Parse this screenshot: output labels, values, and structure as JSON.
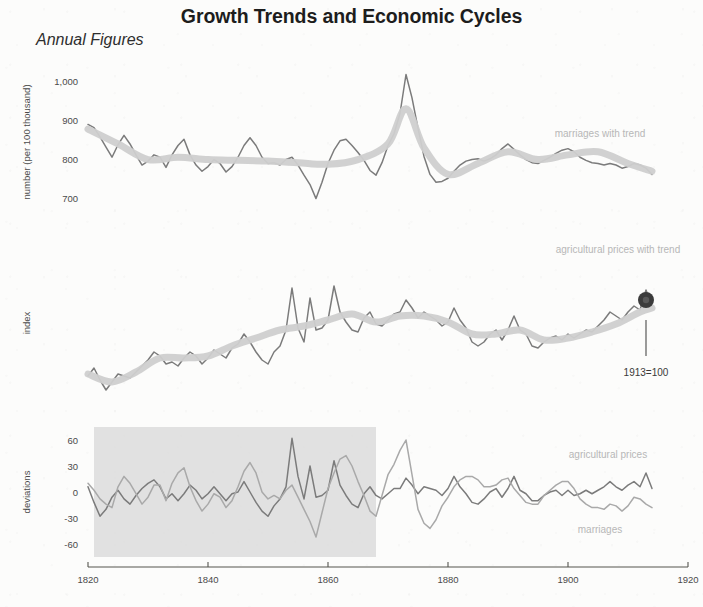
{
  "header": {
    "title": "Growth Trends and Economic Cycles",
    "subtitle": "Annual Figures"
  },
  "labels": {
    "marriages_with_trend": "marriages with trend",
    "agricultural_prices_with_trend": "agricultural prices with trend",
    "agricultural_prices": "agricultural prices",
    "marriages": "marriages",
    "base_note": "1913=100"
  },
  "axis": {
    "x_ticks": [
      "1820",
      "1840",
      "1860",
      "1880",
      "1900",
      "1920"
    ],
    "panel1_y_label": "number (per 100 thousand)",
    "panel1_y_ticks": [
      "1,000",
      "900",
      "800",
      "700"
    ],
    "panel2_y_label": "index",
    "panel2_y_ticks": [],
    "panel3_y_label": "deviations",
    "panel3_y_ticks": [
      "60",
      "30",
      "0",
      "-30",
      "-60"
    ]
  },
  "colors": {
    "data_line": "#7b7b7b",
    "data_line_light": "#a9a9a9",
    "trend_band": "#cfcfcf",
    "shade_region": "#d7d7d7",
    "axis": "#55554f",
    "series_label": "#b7b7b7",
    "title": "#1d1d1d",
    "background": "#fcfcfb"
  },
  "chart_data": {
    "type": "line",
    "title": "Growth Trends and Economic Cycles",
    "subtitle": "Annual Figures",
    "xlabel": "",
    "xlim": [
      1820,
      1920
    ],
    "grid": false,
    "legend": "inline-labels",
    "panels": [
      {
        "id": "marriages",
        "ylabel": "number (per 100 thousand)",
        "ylim": [
          640,
          1050
        ],
        "yticks": [
          700,
          800,
          900,
          1000
        ],
        "series": [
          {
            "name": "marriages",
            "style": "thin-line",
            "x": [
              1820,
              1821,
              1822,
              1823,
              1824,
              1825,
              1826,
              1827,
              1828,
              1829,
              1830,
              1831,
              1832,
              1833,
              1834,
              1835,
              1836,
              1837,
              1838,
              1839,
              1840,
              1841,
              1842,
              1843,
              1844,
              1845,
              1846,
              1847,
              1848,
              1849,
              1850,
              1851,
              1852,
              1853,
              1854,
              1855,
              1856,
              1857,
              1858,
              1859,
              1860,
              1861,
              1862,
              1863,
              1864,
              1865,
              1866,
              1867,
              1868,
              1869,
              1870,
              1871,
              1872,
              1873,
              1874,
              1875,
              1876,
              1877,
              1878,
              1879,
              1880,
              1881,
              1882,
              1883,
              1884,
              1885,
              1886,
              1887,
              1888,
              1889,
              1890,
              1891,
              1892,
              1893,
              1894,
              1895,
              1896,
              1897,
              1898,
              1899,
              1900,
              1901,
              1902,
              1903,
              1904,
              1905,
              1906,
              1907,
              1908,
              1909,
              1910,
              1911,
              1912,
              1913,
              1914
            ],
            "values": [
              890,
              882,
              858,
              832,
              806,
              838,
              862,
              840,
              812,
              786,
              796,
              812,
              806,
              780,
              812,
              836,
              852,
              812,
              786,
              770,
              782,
              800,
              790,
              768,
              782,
              806,
              836,
              856,
              836,
              806,
              790,
              792,
              786,
              800,
              806,
              786,
              760,
              736,
              700,
              742,
              790,
              824,
              848,
              852,
              836,
              818,
              798,
              772,
              760,
              792,
              836,
              866,
              918,
              1018,
              958,
              880,
              808,
              762,
              742,
              744,
              752,
              770,
              786,
              796,
              800,
              802,
              796,
              802,
              812,
              828,
              840,
              826,
              812,
              800,
              792,
              790,
              798,
              806,
              816,
              824,
              828,
              820,
              806,
              798,
              792,
              790,
              786,
              790,
              786,
              778,
              782,
              790,
              786,
              778,
              762
            ]
          },
          {
            "name": "marriages trend",
            "style": "thick-band",
            "x": [
              1820,
              1825,
              1830,
              1835,
              1840,
              1845,
              1850,
              1855,
              1860,
              1865,
              1870,
              1873,
              1876,
              1880,
              1885,
              1890,
              1895,
              1900,
              1905,
              1910,
              1914
            ],
            "values": [
              878,
              840,
              800,
              806,
              800,
              798,
              796,
              792,
              788,
              800,
              840,
              930,
              830,
              762,
              790,
              820,
              800,
              812,
              820,
              790,
              770
            ]
          }
        ]
      },
      {
        "id": "agricultural_prices",
        "ylabel": "index",
        "ylim": [
          40,
          190
        ],
        "yticks": [],
        "series": [
          {
            "name": "agricultural prices",
            "style": "thin-line",
            "x": [
              1820,
              1821,
              1822,
              1823,
              1824,
              1825,
              1826,
              1827,
              1828,
              1829,
              1830,
              1831,
              1832,
              1833,
              1834,
              1835,
              1836,
              1837,
              1838,
              1839,
              1840,
              1841,
              1842,
              1843,
              1844,
              1845,
              1846,
              1847,
              1848,
              1849,
              1850,
              1851,
              1852,
              1853,
              1854,
              1855,
              1856,
              1857,
              1858,
              1859,
              1860,
              1861,
              1862,
              1863,
              1864,
              1865,
              1866,
              1867,
              1868,
              1869,
              1870,
              1871,
              1872,
              1873,
              1874,
              1875,
              1876,
              1877,
              1878,
              1879,
              1880,
              1881,
              1882,
              1883,
              1884,
              1885,
              1886,
              1887,
              1888,
              1889,
              1890,
              1891,
              1892,
              1893,
              1894,
              1895,
              1896,
              1897,
              1898,
              1899,
              1900,
              1901,
              1902,
              1903,
              1904,
              1905,
              1906,
              1907,
              1908,
              1909,
              1910,
              1911,
              1912,
              1913,
              1914
            ],
            "values": [
              62,
              70,
              58,
              48,
              56,
              64,
              62,
              60,
              66,
              72,
              78,
              86,
              82,
              74,
              76,
              72,
              80,
              86,
              82,
              74,
              80,
              88,
              84,
              80,
              90,
              94,
              104,
              96,
              86,
              78,
              74,
              86,
              92,
              108,
              150,
              110,
              96,
              140,
              108,
              110,
              118,
              152,
              126,
              116,
              108,
              106,
              120,
              126,
              114,
              112,
              118,
              124,
              126,
              138,
              130,
              120,
              126,
              122,
              118,
              112,
              116,
              130,
              118,
              110,
              96,
              92,
              96,
              104,
              108,
              98,
              108,
              122,
              108,
              104,
              92,
              90,
              96,
              100,
              102,
              98,
              104,
              100,
              104,
              108,
              106,
              112,
              118,
              126,
              122,
              118,
              126,
              132,
              128,
              148,
              132
            ]
          },
          {
            "name": "agricultural prices trend",
            "style": "thick-band",
            "x": [
              1820,
              1824,
              1828,
              1832,
              1836,
              1840,
              1844,
              1848,
              1852,
              1856,
              1860,
              1864,
              1868,
              1872,
              1876,
              1880,
              1884,
              1888,
              1892,
              1896,
              1900,
              1904,
              1908,
              1912,
              1914
            ],
            "values": [
              64,
              56,
              66,
              80,
              80,
              82,
              92,
              100,
              108,
              112,
              118,
              124,
              116,
              122,
              122,
              116,
              104,
              104,
              108,
              98,
              100,
              106,
              114,
              126,
              130
            ]
          }
        ]
      },
      {
        "id": "deviations",
        "ylabel": "deviations",
        "ylim": [
          -75,
          75
        ],
        "yticks": [
          -60,
          -30,
          0,
          30,
          60
        ],
        "shaded_region": {
          "from": 1821,
          "to": 1868
        },
        "series": [
          {
            "name": "agricultural prices",
            "style": "thin-line-dark",
            "x": [
              1820,
              1821,
              1822,
              1823,
              1824,
              1825,
              1826,
              1827,
              1828,
              1829,
              1830,
              1831,
              1832,
              1833,
              1834,
              1835,
              1836,
              1837,
              1838,
              1839,
              1840,
              1841,
              1842,
              1843,
              1844,
              1845,
              1846,
              1847,
              1848,
              1849,
              1850,
              1851,
              1852,
              1853,
              1854,
              1855,
              1856,
              1857,
              1858,
              1859,
              1860,
              1861,
              1862,
              1863,
              1864,
              1865,
              1866,
              1867,
              1868,
              1869,
              1870,
              1871,
              1872,
              1873,
              1874,
              1875,
              1876,
              1877,
              1878,
              1879,
              1880,
              1881,
              1882,
              1883,
              1884,
              1885,
              1886,
              1887,
              1888,
              1889,
              1890,
              1891,
              1892,
              1893,
              1894,
              1895,
              1896,
              1897,
              1898,
              1899,
              1900,
              1901,
              1902,
              1903,
              1904,
              1905,
              1906,
              1907,
              1908,
              1909,
              1910,
              1911,
              1912,
              1913,
              1914
            ],
            "values": [
              6,
              -12,
              -28,
              -20,
              -6,
              2,
              -8,
              -14,
              -4,
              4,
              10,
              14,
              6,
              -8,
              -2,
              -10,
              -2,
              8,
              2,
              -8,
              -2,
              6,
              -2,
              -10,
              -2,
              0,
              12,
              0,
              -12,
              -22,
              -28,
              -16,
              -8,
              6,
              62,
              18,
              -8,
              30,
              -6,
              -4,
              2,
              36,
              8,
              -4,
              -14,
              -18,
              -2,
              6,
              -4,
              -8,
              -2,
              4,
              4,
              16,
              8,
              -2,
              6,
              4,
              2,
              -4,
              4,
              18,
              6,
              -2,
              -12,
              -14,
              -8,
              0,
              4,
              -6,
              4,
              18,
              2,
              -2,
              -10,
              -10,
              -4,
              0,
              2,
              -4,
              2,
              -4,
              -2,
              2,
              -2,
              2,
              6,
              12,
              6,
              2,
              8,
              12,
              6,
              22,
              4
            ]
          },
          {
            "name": "marriages",
            "style": "thin-line-light",
            "x": [
              1820,
              1821,
              1822,
              1823,
              1824,
              1825,
              1826,
              1827,
              1828,
              1829,
              1830,
              1831,
              1832,
              1833,
              1834,
              1835,
              1836,
              1837,
              1838,
              1839,
              1840,
              1841,
              1842,
              1843,
              1844,
              1845,
              1846,
              1847,
              1848,
              1849,
              1850,
              1851,
              1852,
              1853,
              1854,
              1855,
              1856,
              1857,
              1858,
              1859,
              1860,
              1861,
              1862,
              1863,
              1864,
              1865,
              1866,
              1867,
              1868,
              1869,
              1870,
              1871,
              1872,
              1873,
              1874,
              1875,
              1876,
              1877,
              1878,
              1879,
              1880,
              1881,
              1882,
              1883,
              1884,
              1885,
              1886,
              1887,
              1888,
              1889,
              1890,
              1891,
              1892,
              1893,
              1894,
              1895,
              1896,
              1897,
              1898,
              1899,
              1900,
              1901,
              1902,
              1903,
              1904,
              1905,
              1906,
              1907,
              1908,
              1909,
              1910,
              1911,
              1912,
              1913,
              1914
            ],
            "values": [
              10,
              2,
              -8,
              -14,
              -18,
              6,
              18,
              10,
              -2,
              -14,
              -6,
              8,
              8,
              -10,
              10,
              22,
              28,
              6,
              -10,
              -22,
              -14,
              -2,
              -6,
              -18,
              -10,
              6,
              24,
              34,
              22,
              0,
              -8,
              -4,
              -8,
              2,
              8,
              -6,
              -20,
              -34,
              -52,
              -24,
              4,
              22,
              38,
              42,
              30,
              12,
              -4,
              -22,
              -28,
              -4,
              20,
              32,
              48,
              60,
              20,
              -20,
              -36,
              -42,
              -32,
              -16,
              -6,
              6,
              14,
              18,
              18,
              14,
              6,
              6,
              8,
              14,
              16,
              4,
              -4,
              -12,
              -14,
              -14,
              -4,
              2,
              8,
              12,
              12,
              4,
              -8,
              -14,
              -18,
              -18,
              -20,
              -14,
              -16,
              -22,
              -16,
              -6,
              -8,
              -14,
              -18
            ]
          }
        ]
      }
    ]
  }
}
